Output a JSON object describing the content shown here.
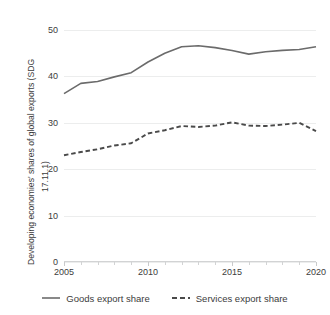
{
  "chart_data": {
    "type": "line",
    "title": "",
    "xlabel": "",
    "ylabel_line1": "Developing economies' shares of global exports (SDG",
    "ylabel_line2": "17.11.1)",
    "x": [
      2005,
      2006,
      2007,
      2008,
      2009,
      2010,
      2011,
      2012,
      2013,
      2014,
      2015,
      2016,
      2017,
      2018,
      2019,
      2020
    ],
    "xlim": [
      2005,
      2020
    ],
    "ylim": [
      0,
      50
    ],
    "yticks": [
      0,
      10,
      20,
      30,
      40,
      50
    ],
    "xticks": [
      2005,
      2010,
      2015,
      2020
    ],
    "xtick_labels": [
      "2005",
      "2010",
      "2015",
      "2020"
    ],
    "grid": true,
    "grid_color": "#eceded",
    "legend_position": "bottom",
    "series": [
      {
        "name": "Goods export share",
        "style": "solid",
        "color": "#6b6b6b",
        "values": [
          36.3,
          38.5,
          38.9,
          39.9,
          40.8,
          43.1,
          45.0,
          46.4,
          46.6,
          46.2,
          45.6,
          44.8,
          45.3,
          45.6,
          45.8,
          46.4
        ]
      },
      {
        "name": "Services export share",
        "style": "dashed",
        "color": "#4a4a4a",
        "values": [
          23.0,
          23.7,
          24.3,
          25.1,
          25.6,
          27.7,
          28.4,
          29.3,
          29.1,
          29.4,
          30.1,
          29.4,
          29.3,
          29.6,
          30.0,
          28.2
        ]
      }
    ]
  },
  "legend": {
    "items": [
      {
        "label": "Goods export share",
        "marker": "solid-line-icon"
      },
      {
        "label": "Services export share",
        "marker": "dashed-line-icon"
      }
    ]
  }
}
